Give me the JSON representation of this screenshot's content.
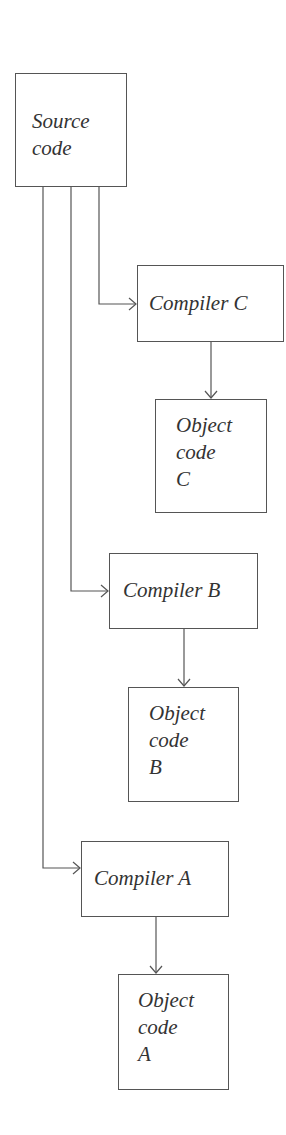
{
  "diagram": {
    "type": "flowchart",
    "nodes": [
      {
        "id": "source",
        "label": "Source\ncode"
      },
      {
        "id": "compiler_c",
        "label": "Compiler C"
      },
      {
        "id": "object_c",
        "label": "Object\ncode\nC"
      },
      {
        "id": "compiler_b",
        "label": "Compiler B"
      },
      {
        "id": "object_b",
        "label": "Object\ncode\nB"
      },
      {
        "id": "compiler_a",
        "label": "Compiler A"
      },
      {
        "id": "object_a",
        "label": "Object\ncode\nA"
      }
    ],
    "edges": [
      {
        "from": "source",
        "to": "compiler_c"
      },
      {
        "from": "compiler_c",
        "to": "object_c"
      },
      {
        "from": "source",
        "to": "compiler_b"
      },
      {
        "from": "compiler_b",
        "to": "object_b"
      },
      {
        "from": "source",
        "to": "compiler_a"
      },
      {
        "from": "compiler_a",
        "to": "object_a"
      }
    ],
    "colors": {
      "line": "#555555",
      "text": "#333333",
      "background": "#ffffff"
    }
  }
}
